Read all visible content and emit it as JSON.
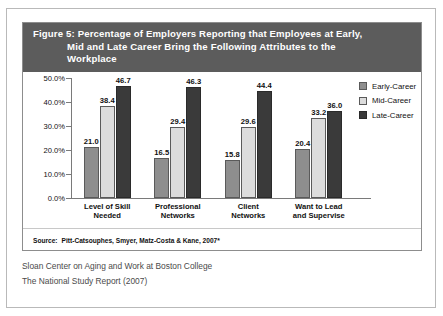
{
  "figure": {
    "title_line1": "Figure 5: Percentage of Employers Reporting that Employees at Early,",
    "title_line2": "Mid and Late Career Bring the Following Attributes to the",
    "title_line3": "Workplace",
    "source_label": "Source:",
    "source_text": "Pitt-Catsouphes, Smyer, Matz-Costa & Kane, 2007*"
  },
  "caption": {
    "line1": "Sloan Center on Aging and Work at Boston College",
    "line2": "The National Study Report (2007)"
  },
  "colors": {
    "title_bar": "#5c5c5c",
    "early": "#8e8e8e",
    "mid": "#dcdcdc",
    "late": "#3a3a3a"
  },
  "chart_data": {
    "type": "bar",
    "title": "Figure 5: Percentage of Employers Reporting that Employees at Early, Mid and Late Career Bring the Following Attributes to the Workplace",
    "xlabel": "",
    "ylabel": "",
    "ylim": [
      0,
      50
    ],
    "yticks": [
      "0.0%",
      "10.0%",
      "20.0%",
      "30.0%",
      "40.0%",
      "50.0%"
    ],
    "grid": false,
    "legend_position": "right",
    "categories": [
      "Level of Skill Needed",
      "Professional Networks",
      "Client Networks",
      "Want to Lead and Supervise"
    ],
    "category_lines": [
      [
        "Level of Skill",
        "Needed"
      ],
      [
        "Professional",
        "Networks"
      ],
      [
        "Client",
        "Networks"
      ],
      [
        "Want to Lead",
        "and Supervise"
      ]
    ],
    "series": [
      {
        "name": "Early-Career",
        "color": "#8e8e8e",
        "values": [
          21.0,
          16.5,
          15.8,
          20.4
        ],
        "labels": [
          "21.0",
          "16.5",
          "15.8",
          "20.4"
        ]
      },
      {
        "name": "Mid-Career",
        "color": "#dcdcdc",
        "values": [
          38.4,
          29.4,
          29.6,
          33.2
        ],
        "labels": [
          "38.4",
          "29.4",
          "29.6",
          "33.2"
        ]
      },
      {
        "name": "Late-Career",
        "color": "#3a3a3a",
        "values": [
          46.7,
          46.3,
          44.4,
          36.0
        ],
        "labels": [
          "46.7",
          "46.3",
          "44.4",
          "36.0"
        ]
      }
    ]
  }
}
